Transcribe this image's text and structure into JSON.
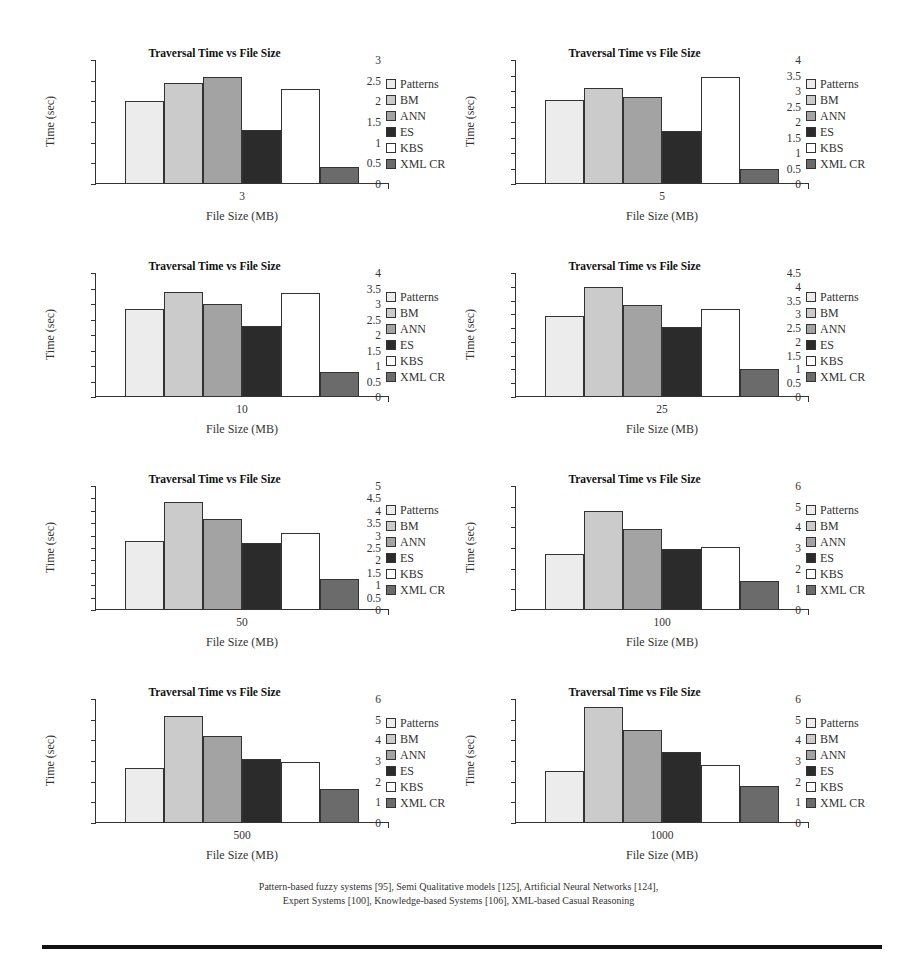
{
  "series": [
    {
      "name": "Patterns",
      "color": "#ececec"
    },
    {
      "name": "BM",
      "color": "#cbcbcb"
    },
    {
      "name": "ANN",
      "color": "#a3a3a3"
    },
    {
      "name": "ES",
      "color": "#2b2b2b"
    },
    {
      "name": "KBS",
      "color": "#ffffff"
    },
    {
      "name": "XML CR",
      "color": "#6b6b6b"
    }
  ],
  "caption": {
    "line1": "Pattern-based fuzzy systems [95], Semi Qualitative models [125], Artificial Neural Networks [124],",
    "line2": "Expert Systems [100], Knowledge-based Systems [106], XML-based Casual Reasoning"
  },
  "chart_data": [
    {
      "type": "bar",
      "title": "Traversal Time vs File Size",
      "xlabel": "File Size (MB)",
      "ylabel": "Time (sec)",
      "categories": [
        "3"
      ],
      "ylim": [
        0,
        3
      ],
      "yticks": [
        0,
        0.5,
        1,
        1.5,
        2,
        2.5,
        3
      ],
      "legend_position": "right",
      "series": [
        {
          "name": "Patterns",
          "values": [
            2.0
          ]
        },
        {
          "name": "BM",
          "values": [
            2.45
          ]
        },
        {
          "name": "ANN",
          "values": [
            2.6
          ]
        },
        {
          "name": "ES",
          "values": [
            1.3
          ]
        },
        {
          "name": "KBS",
          "values": [
            2.3
          ]
        },
        {
          "name": "XML CR",
          "values": [
            0.4
          ]
        }
      ]
    },
    {
      "type": "bar",
      "title": "Traversal Time vs File Size",
      "xlabel": "File Size (MB)",
      "ylabel": "Time (sec)",
      "categories": [
        "5"
      ],
      "ylim": [
        0,
        4
      ],
      "yticks": [
        0,
        0.5,
        1,
        1.5,
        2,
        2.5,
        3,
        3.5,
        4
      ],
      "legend_position": "right",
      "series": [
        {
          "name": "Patterns",
          "values": [
            2.7
          ]
        },
        {
          "name": "BM",
          "values": [
            3.1
          ]
        },
        {
          "name": "ANN",
          "values": [
            2.8
          ]
        },
        {
          "name": "ES",
          "values": [
            1.7
          ]
        },
        {
          "name": "KBS",
          "values": [
            3.45
          ]
        },
        {
          "name": "XML CR",
          "values": [
            0.5
          ]
        }
      ]
    },
    {
      "type": "bar",
      "title": "Traversal Time vs File Size",
      "xlabel": "File Size (MB)",
      "ylabel": "Time (sec)",
      "categories": [
        "10"
      ],
      "ylim": [
        0,
        4
      ],
      "yticks": [
        0,
        0.5,
        1,
        1.5,
        2,
        2.5,
        3,
        3.5,
        4
      ],
      "legend_position": "right",
      "series": [
        {
          "name": "Patterns",
          "values": [
            2.85
          ]
        },
        {
          "name": "BM",
          "values": [
            3.4
          ]
        },
        {
          "name": "ANN",
          "values": [
            3.0
          ]
        },
        {
          "name": "ES",
          "values": [
            2.3
          ]
        },
        {
          "name": "KBS",
          "values": [
            3.35
          ]
        },
        {
          "name": "XML CR",
          "values": [
            0.8
          ]
        }
      ]
    },
    {
      "type": "bar",
      "title": "Traversal Time vs File Size",
      "xlabel": "File Size (MB)",
      "ylabel": "Time (sec)",
      "categories": [
        "25"
      ],
      "ylim": [
        0,
        4.5
      ],
      "yticks": [
        0,
        0.5,
        1,
        1.5,
        2,
        2.5,
        3,
        3.5,
        4,
        4.5
      ],
      "legend_position": "right",
      "series": [
        {
          "name": "Patterns",
          "values": [
            2.95
          ]
        },
        {
          "name": "BM",
          "values": [
            4.0
          ]
        },
        {
          "name": "ANN",
          "values": [
            3.35
          ]
        },
        {
          "name": "ES",
          "values": [
            2.55
          ]
        },
        {
          "name": "KBS",
          "values": [
            3.2
          ]
        },
        {
          "name": "XML CR",
          "values": [
            1.0
          ]
        }
      ]
    },
    {
      "type": "bar",
      "title": "Traversal Time vs File Size",
      "xlabel": "File Size (MB)",
      "ylabel": "Time (sec)",
      "categories": [
        "50"
      ],
      "ylim": [
        0,
        5
      ],
      "yticks": [
        0,
        0.5,
        1,
        1.5,
        2,
        2.5,
        3,
        3.5,
        4,
        4.5,
        5
      ],
      "legend_position": "right",
      "series": [
        {
          "name": "Patterns",
          "values": [
            2.8
          ]
        },
        {
          "name": "BM",
          "values": [
            4.35
          ]
        },
        {
          "name": "ANN",
          "values": [
            3.65
          ]
        },
        {
          "name": "ES",
          "values": [
            2.7
          ]
        },
        {
          "name": "KBS",
          "values": [
            3.1
          ]
        },
        {
          "name": "XML CR",
          "values": [
            1.25
          ]
        }
      ]
    },
    {
      "type": "bar",
      "title": "Traversal Time vs File Size",
      "xlabel": "File Size (MB)",
      "ylabel": "Time (sec)",
      "categories": [
        "100"
      ],
      "ylim": [
        0,
        6
      ],
      "yticks": [
        0,
        1,
        2,
        3,
        4,
        5,
        6
      ],
      "legend_position": "right",
      "series": [
        {
          "name": "Patterns",
          "values": [
            2.7
          ]
        },
        {
          "name": "BM",
          "values": [
            4.8
          ]
        },
        {
          "name": "ANN",
          "values": [
            3.9
          ]
        },
        {
          "name": "ES",
          "values": [
            2.95
          ]
        },
        {
          "name": "KBS",
          "values": [
            3.05
          ]
        },
        {
          "name": "XML CR",
          "values": [
            1.4
          ]
        }
      ]
    },
    {
      "type": "bar",
      "title": "Traversal Time vs File Size",
      "xlabel": "File Size (MB)",
      "ylabel": "Time (sec)",
      "categories": [
        "500"
      ],
      "ylim": [
        0,
        6
      ],
      "yticks": [
        0,
        1,
        2,
        3,
        4,
        5,
        6
      ],
      "legend_position": "right",
      "series": [
        {
          "name": "Patterns",
          "values": [
            2.65
          ]
        },
        {
          "name": "BM",
          "values": [
            5.2
          ]
        },
        {
          "name": "ANN",
          "values": [
            4.2
          ]
        },
        {
          "name": "ES",
          "values": [
            3.1
          ]
        },
        {
          "name": "KBS",
          "values": [
            2.95
          ]
        },
        {
          "name": "XML CR",
          "values": [
            1.65
          ]
        }
      ]
    },
    {
      "type": "bar",
      "title": "Traversal Time vs File Size",
      "xlabel": "File Size (MB)",
      "ylabel": "Time (sec)",
      "categories": [
        "1000"
      ],
      "ylim": [
        0,
        6
      ],
      "yticks": [
        0,
        1,
        2,
        3,
        4,
        5,
        6
      ],
      "legend_position": "right",
      "series": [
        {
          "name": "Patterns",
          "values": [
            2.5
          ]
        },
        {
          "name": "BM",
          "values": [
            5.6
          ]
        },
        {
          "name": "ANN",
          "values": [
            4.5
          ]
        },
        {
          "name": "ES",
          "values": [
            3.45
          ]
        },
        {
          "name": "KBS",
          "values": [
            2.8
          ]
        },
        {
          "name": "XML CR",
          "values": [
            1.8
          ]
        }
      ]
    }
  ]
}
